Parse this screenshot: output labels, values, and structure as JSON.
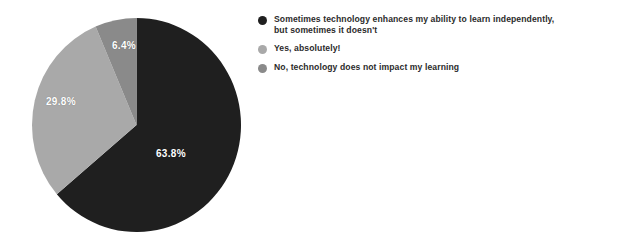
{
  "chart_data": {
    "type": "pie",
    "title": "",
    "subtitle": "",
    "labels": [
      "Sometimes technology enhances my ability to learn independently, but sometimes it doesn't",
      "Yes, absolutely!",
      "No, technology does not impact my learning"
    ],
    "values": [
      63.8,
      29.8,
      6.4
    ],
    "value_labels": [
      "63.8%",
      "29.8%",
      "6.4%"
    ],
    "units": "percent",
    "colors": [
      "#1f1f1f",
      "#a9a9a9",
      "#8a8a8a"
    ],
    "start_angle_deg": 0,
    "direction": "clockwise",
    "grid": false,
    "legend_position": "right",
    "label_text_color": "#ffffff",
    "background_color": "#ffffff"
  },
  "legend": {
    "items": [
      {
        "line1": "Sometimes technology enhances my ability to learn independently,",
        "line2": "but sometimes it doesn't",
        "color": "#1f1f1f"
      },
      {
        "line1": "Yes, absolutely!",
        "line2": "",
        "color": "#a9a9a9"
      },
      {
        "line1": "No, technology does not impact my learning",
        "line2": "",
        "color": "#8a8a8a"
      }
    ]
  },
  "pie_labels": {
    "slice0": "63.8%",
    "slice1": "29.8%",
    "slice2": "6.4%"
  }
}
